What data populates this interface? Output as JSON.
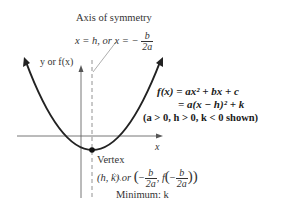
{
  "axis_of_symmetry": {
    "title": "Axis of symmetry",
    "eq_prefix": "x = h, or x = −",
    "frac_num": "b",
    "frac_den": "2a"
  },
  "axes": {
    "y_label": "y or f(x)",
    "x_label": "x"
  },
  "equations": {
    "line1": "f(x) = ax² + bx + c",
    "line2": "= a(x − h)² + k",
    "line3": "(a > 0, h > 0, k < 0 shown)"
  },
  "vertex": {
    "title": "Vertex",
    "coords_prefix": "(h, k) or",
    "frac_num": "b",
    "frac_den": "2a",
    "minimum_label": "Minimum: k"
  },
  "colors": {
    "curve": "#222222",
    "axes": "#555555",
    "dashed": "#777777"
  }
}
